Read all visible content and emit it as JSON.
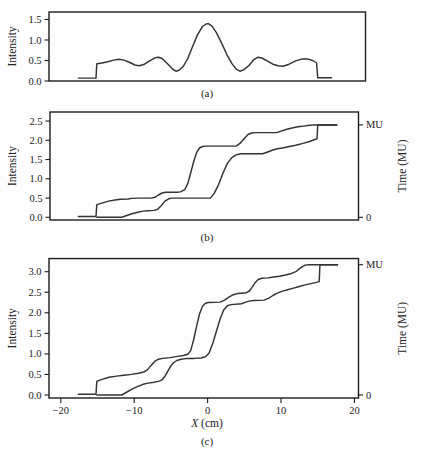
{
  "figure": {
    "background": "#fdfdfd",
    "line_color": "#333333",
    "frame_color": "#1c1c1c",
    "text_color": "#222222",
    "captions": [
      "(a)",
      "(b)",
      "(c)"
    ]
  },
  "x_axis": {
    "label_variable": "X",
    "label_unit": " (cm)",
    "ticks": [
      {
        "v": -20,
        "label": "−20"
      },
      {
        "v": -10,
        "label": "−10"
      },
      {
        "v": 0,
        "label": "0"
      },
      {
        "v": 10,
        "label": "10"
      },
      {
        "v": 20,
        "label": "20"
      }
    ],
    "xlim": [
      -21.6,
      20.6
    ]
  },
  "chart_data": [
    {
      "id": "a",
      "type": "line",
      "caption": "(a)",
      "ylabel": "Intensity",
      "yticks": [
        0.0,
        0.5,
        1.0,
        1.5
      ],
      "ylim": [
        0,
        1.683
      ],
      "xlim": [
        -21.6,
        21.5
      ],
      "grid": false,
      "series": [
        {
          "name": "intensity-profile",
          "points": [
            [
              -17.6,
              0.07
            ],
            [
              -15.2,
              0.07
            ],
            [
              -15.1,
              0.42
            ],
            [
              -14.4,
              0.44
            ],
            [
              -13.6,
              0.47
            ],
            [
              -12.8,
              0.51
            ],
            [
              -12.1,
              0.53
            ],
            [
              -11.4,
              0.51
            ],
            [
              -10.6,
              0.45
            ],
            [
              -9.9,
              0.39
            ],
            [
              -9.3,
              0.37
            ],
            [
              -8.6,
              0.41
            ],
            [
              -7.9,
              0.49
            ],
            [
              -7.1,
              0.57
            ],
            [
              -6.7,
              0.58
            ],
            [
              -6.2,
              0.55
            ],
            [
              -5.4,
              0.41
            ],
            [
              -4.7,
              0.28
            ],
            [
              -4.3,
              0.24
            ],
            [
              -3.9,
              0.26
            ],
            [
              -3.3,
              0.36
            ],
            [
              -2.7,
              0.55
            ],
            [
              -2.1,
              0.82
            ],
            [
              -1.4,
              1.12
            ],
            [
              -0.7,
              1.33
            ],
            [
              -0.2,
              1.39
            ],
            [
              0.1,
              1.4
            ],
            [
              0.6,
              1.34
            ],
            [
              1.2,
              1.18
            ],
            [
              1.9,
              0.93
            ],
            [
              2.6,
              0.65
            ],
            [
              3.3,
              0.43
            ],
            [
              3.9,
              0.29
            ],
            [
              4.4,
              0.24
            ],
            [
              4.9,
              0.27
            ],
            [
              5.6,
              0.37
            ],
            [
              6.3,
              0.52
            ],
            [
              6.9,
              0.58
            ],
            [
              7.4,
              0.56
            ],
            [
              8.1,
              0.49
            ],
            [
              8.9,
              0.41
            ],
            [
              9.6,
              0.37
            ],
            [
              10.3,
              0.36
            ],
            [
              11.1,
              0.41
            ],
            [
              12.0,
              0.49
            ],
            [
              12.9,
              0.54
            ],
            [
              13.6,
              0.54
            ],
            [
              14.3,
              0.5
            ],
            [
              14.85,
              0.44
            ],
            [
              15.0,
              0.08
            ],
            [
              16.9,
              0.08
            ]
          ]
        }
      ]
    },
    {
      "id": "b",
      "type": "line",
      "caption": "(b)",
      "ylabel": "Intensity",
      "right_ylabel": "Time (MU)",
      "yticks": [
        0.0,
        0.5,
        1.0,
        1.5,
        2.0,
        2.5
      ],
      "right_ticks": [
        {
          "label": "MU",
          "v": 2.4
        },
        {
          "label": "0",
          "v": 0
        }
      ],
      "ylim": [
        -0.07,
        2.735
      ],
      "xlim": [
        -21.5,
        20.6
      ],
      "grid": false,
      "series": [
        {
          "name": "leading-leaf-trajectory",
          "points": [
            [
              -17.6,
              0.02
            ],
            [
              -15.2,
              0.02
            ],
            [
              -15.1,
              0.33
            ],
            [
              -14.4,
              0.37
            ],
            [
              -13.5,
              0.42
            ],
            [
              -12.6,
              0.45
            ],
            [
              -11.9,
              0.47
            ],
            [
              -10.8,
              0.475
            ],
            [
              -10.4,
              0.49
            ],
            [
              -9.6,
              0.5
            ],
            [
              -7.7,
              0.5
            ],
            [
              -7.2,
              0.52
            ],
            [
              -6.7,
              0.58
            ],
            [
              -6.2,
              0.63
            ],
            [
              -5.7,
              0.65
            ],
            [
              -4.2,
              0.65
            ],
            [
              -3.7,
              0.66
            ],
            [
              -3.1,
              0.72
            ],
            [
              -2.7,
              0.88
            ],
            [
              -2.3,
              1.15
            ],
            [
              -1.9,
              1.45
            ],
            [
              -1.5,
              1.68
            ],
            [
              -1.1,
              1.8
            ],
            [
              -0.7,
              1.84
            ],
            [
              -0.3,
              1.85
            ],
            [
              3.9,
              1.85
            ],
            [
              4.4,
              1.92
            ],
            [
              5.0,
              2.05
            ],
            [
              5.5,
              2.15
            ],
            [
              6.0,
              2.19
            ],
            [
              6.5,
              2.2
            ],
            [
              9.4,
              2.2
            ],
            [
              9.9,
              2.23
            ],
            [
              10.7,
              2.28
            ],
            [
              11.5,
              2.32
            ],
            [
              12.3,
              2.35
            ],
            [
              13.1,
              2.37
            ],
            [
              13.9,
              2.39
            ],
            [
              14.6,
              2.4
            ],
            [
              17.6,
              2.4
            ]
          ]
        },
        {
          "name": "trailing-leaf-trajectory",
          "points": [
            [
              -15.1,
              0.0
            ],
            [
              -11.7,
              0.0
            ],
            [
              -11.1,
              0.04
            ],
            [
              -10.3,
              0.09
            ],
            [
              -9.5,
              0.13
            ],
            [
              -8.8,
              0.16
            ],
            [
              -8.1,
              0.17
            ],
            [
              -7.3,
              0.18
            ],
            [
              -6.8,
              0.21
            ],
            [
              -6.3,
              0.31
            ],
            [
              -5.8,
              0.42
            ],
            [
              -5.3,
              0.48
            ],
            [
              -4.9,
              0.5
            ],
            [
              0.4,
              0.5
            ],
            [
              0.9,
              0.62
            ],
            [
              1.5,
              0.85
            ],
            [
              2.1,
              1.15
            ],
            [
              2.7,
              1.4
            ],
            [
              3.3,
              1.55
            ],
            [
              3.9,
              1.62
            ],
            [
              4.5,
              1.65
            ],
            [
              7.5,
              1.65
            ],
            [
              8.1,
              1.69
            ],
            [
              8.8,
              1.74
            ],
            [
              9.5,
              1.78
            ],
            [
              10.2,
              1.8
            ],
            [
              11.0,
              1.83
            ],
            [
              12.0,
              1.87
            ],
            [
              13.0,
              1.92
            ],
            [
              13.9,
              1.97
            ],
            [
              14.6,
              2.02
            ],
            [
              14.9,
              2.04
            ],
            [
              15.0,
              2.38
            ],
            [
              15.2,
              2.4
            ],
            [
              17.6,
              2.4
            ]
          ]
        }
      ]
    },
    {
      "id": "c",
      "type": "line",
      "caption": "(c)",
      "ylabel": "Intensity",
      "right_ylabel": "Time (MU)",
      "yticks": [
        0.0,
        0.5,
        1.0,
        1.5,
        2.0,
        2.5,
        3.0
      ],
      "right_ticks": [
        {
          "label": "MU",
          "v": 3.17
        },
        {
          "label": "0",
          "v": 0
        }
      ],
      "ylim": [
        -0.073,
        3.32
      ],
      "xlim": [
        -21.6,
        20.6
      ],
      "grid": false,
      "show_x_axis": true,
      "series": [
        {
          "name": "leading-leaf-trajectory",
          "points": [
            [
              -17.6,
              0.02
            ],
            [
              -15.2,
              0.02
            ],
            [
              -15.1,
              0.33
            ],
            [
              -14.4,
              0.38
            ],
            [
              -13.4,
              0.43
            ],
            [
              -12.4,
              0.46
            ],
            [
              -11.4,
              0.48
            ],
            [
              -10.4,
              0.5
            ],
            [
              -9.4,
              0.53
            ],
            [
              -8.7,
              0.56
            ],
            [
              -8.2,
              0.61
            ],
            [
              -7.7,
              0.72
            ],
            [
              -7.2,
              0.82
            ],
            [
              -6.7,
              0.87
            ],
            [
              -6.1,
              0.89
            ],
            [
              -5.1,
              0.91
            ],
            [
              -4.1,
              0.94
            ],
            [
              -3.3,
              0.96
            ],
            [
              -2.7,
              0.99
            ],
            [
              -2.3,
              1.08
            ],
            [
              -1.9,
              1.35
            ],
            [
              -1.5,
              1.67
            ],
            [
              -1.1,
              1.97
            ],
            [
              -0.7,
              2.16
            ],
            [
              -0.3,
              2.23
            ],
            [
              0.1,
              2.25
            ],
            [
              1.7,
              2.26
            ],
            [
              2.3,
              2.31
            ],
            [
              2.9,
              2.38
            ],
            [
              3.5,
              2.44
            ],
            [
              4.1,
              2.47
            ],
            [
              5.3,
              2.49
            ],
            [
              5.7,
              2.53
            ],
            [
              6.1,
              2.63
            ],
            [
              6.5,
              2.74
            ],
            [
              6.9,
              2.81
            ],
            [
              7.4,
              2.84
            ],
            [
              8.2,
              2.85
            ],
            [
              9.0,
              2.87
            ],
            [
              9.8,
              2.89
            ],
            [
              10.6,
              2.92
            ],
            [
              11.3,
              2.95
            ],
            [
              12.1,
              3.01
            ],
            [
              12.7,
              3.1
            ],
            [
              13.3,
              3.16
            ],
            [
              13.8,
              3.17
            ],
            [
              17.7,
              3.17
            ]
          ]
        },
        {
          "name": "trailing-leaf-trajectory",
          "points": [
            [
              -15.1,
              0.0
            ],
            [
              -11.7,
              0.0
            ],
            [
              -11.1,
              0.06
            ],
            [
              -10.3,
              0.14
            ],
            [
              -9.5,
              0.21
            ],
            [
              -8.8,
              0.26
            ],
            [
              -8.1,
              0.29
            ],
            [
              -7.3,
              0.31
            ],
            [
              -6.7,
              0.33
            ],
            [
              -6.2,
              0.37
            ],
            [
              -5.8,
              0.46
            ],
            [
              -5.4,
              0.59
            ],
            [
              -5.0,
              0.71
            ],
            [
              -4.6,
              0.79
            ],
            [
              -4.2,
              0.84
            ],
            [
              -3.6,
              0.87
            ],
            [
              -2.8,
              0.89
            ],
            [
              -1.8,
              0.89
            ],
            [
              -0.9,
              0.9
            ],
            [
              -0.3,
              0.93
            ],
            [
              0.2,
              1.02
            ],
            [
              0.7,
              1.25
            ],
            [
              1.2,
              1.55
            ],
            [
              1.7,
              1.85
            ],
            [
              2.2,
              2.07
            ],
            [
              2.7,
              2.17
            ],
            [
              3.2,
              2.2
            ],
            [
              4.6,
              2.22
            ],
            [
              5.2,
              2.26
            ],
            [
              5.8,
              2.29
            ],
            [
              6.3,
              2.3
            ],
            [
              7.7,
              2.31
            ],
            [
              8.3,
              2.35
            ],
            [
              8.9,
              2.42
            ],
            [
              9.5,
              2.48
            ],
            [
              10.1,
              2.52
            ],
            [
              10.9,
              2.56
            ],
            [
              11.7,
              2.6
            ],
            [
              12.5,
              2.64
            ],
            [
              13.3,
              2.68
            ],
            [
              14.1,
              2.71
            ],
            [
              14.8,
              2.74
            ],
            [
              15.2,
              2.76
            ],
            [
              15.3,
              3.15
            ],
            [
              15.45,
              3.17
            ],
            [
              17.7,
              3.17
            ]
          ]
        }
      ]
    }
  ]
}
